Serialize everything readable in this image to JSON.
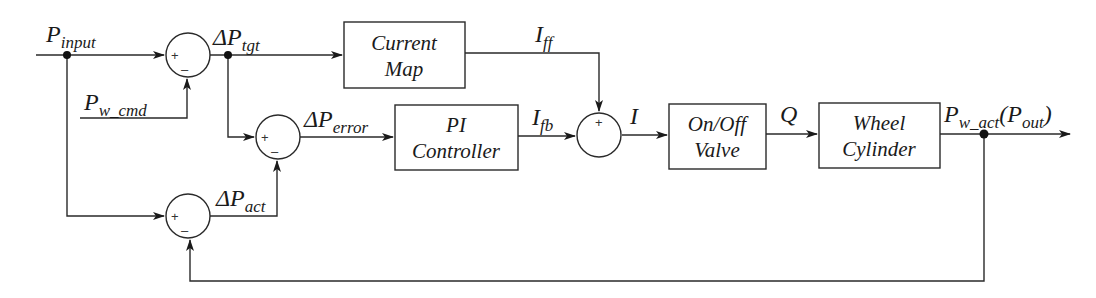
{
  "diagram": {
    "type": "control-block-diagram",
    "signals": {
      "p_input": {
        "main": "P",
        "sub": "input"
      },
      "p_w_cmd": {
        "main": "P",
        "sub": "w_cmd"
      },
      "delta_p_tgt": {
        "main": "ΔP",
        "sub": "tgt"
      },
      "delta_p_error": {
        "main": "ΔP",
        "sub": "error"
      },
      "delta_p_act": {
        "main": "ΔP",
        "sub": "act"
      },
      "i_ff": {
        "main": "I",
        "sub": "ff"
      },
      "i_fb": {
        "main": "I",
        "sub": "fb"
      },
      "i": {
        "main": "I"
      },
      "q": {
        "main": "Q"
      },
      "p_w_act": {
        "main": "P",
        "sub": "w_act",
        "paren_open": "(",
        "paren_main": "P",
        "paren_sub": "out",
        "paren_close": ")"
      }
    },
    "blocks": {
      "current_map": {
        "line1": "Current",
        "line2": "Map"
      },
      "pi_controller": {
        "line1": "PI",
        "line2": "Controller"
      },
      "on_off_valve": {
        "line1": "On/Off",
        "line2": "Valve"
      },
      "wheel_cylinder": {
        "line1": "Wheel",
        "line2": "Cylinder"
      }
    },
    "summing_junctions": {
      "sum_tgt": {
        "plus": "+",
        "minus": "–"
      },
      "sum_error": {
        "plus": "+",
        "minus": "–"
      },
      "sum_act": {
        "plus": "+",
        "minus": "–"
      },
      "sum_current": {
        "plus": "+"
      }
    },
    "colors": {
      "line": "#2a2a2a",
      "text": "#1a1a1a",
      "background": "#ffffff"
    }
  }
}
